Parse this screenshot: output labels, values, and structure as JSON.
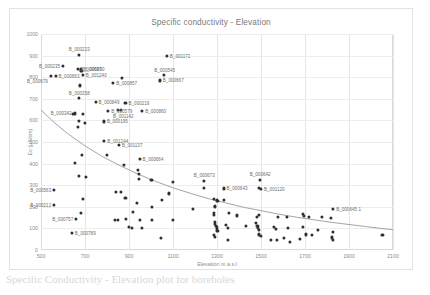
{
  "chart_data": {
    "type": "scatter",
    "title": "Specific conductivity - Elevation",
    "xlabel": "Elevation m a.s.l",
    "ylabel": "Ec (µS/cm)",
    "xlim": [
      500,
      2100
    ],
    "ylim": [
      0,
      1000
    ],
    "xticks": [
      500,
      700,
      900,
      1100,
      1300,
      1500,
      1700,
      1900,
      2100
    ],
    "yticks": [
      0,
      100,
      200,
      300,
      400,
      500,
      600,
      700,
      800,
      900,
      1000
    ],
    "grid": true,
    "legend": "none",
    "marker_color": "#2f2f2f",
    "trendline_color": "#9a9a9a",
    "trendline_type": "power/exponential decay",
    "series": [
      {
        "name": "Boreholes",
        "points": [
          {
            "x": 672,
            "y": 905,
            "label": "B_000223",
            "label_pos": "above"
          },
          {
            "x": 1072,
            "y": 900,
            "label": "B_001172",
            "label_pos": "right"
          },
          {
            "x": 600,
            "y": 852,
            "label": "B_000235",
            "label_pos": "left"
          },
          {
            "x": 667,
            "y": 840,
            "label": "B_000637",
            "label_pos": "right"
          },
          {
            "x": 680,
            "y": 836,
            "label": "B_000890",
            "label_pos": "right"
          },
          {
            "x": 684,
            "y": 828,
            "label": "",
            "label_pos": ""
          },
          {
            "x": 566,
            "y": 806,
            "label": "B_000663",
            "label_pos": "right"
          },
          {
            "x": 690,
            "y": 812,
            "label": "B_001240",
            "label_pos": "right"
          },
          {
            "x": 545,
            "y": 804,
            "label": "B_000679",
            "label_pos": "below-left"
          },
          {
            "x": 1060,
            "y": 810,
            "label": "B_000545",
            "label_pos": "above"
          },
          {
            "x": 1040,
            "y": 785,
            "label": "B_000667",
            "label_pos": "right"
          },
          {
            "x": 870,
            "y": 795,
            "label": "",
            "label_pos": ""
          },
          {
            "x": 828,
            "y": 772,
            "label": "B_000857",
            "label_pos": "right"
          },
          {
            "x": 676,
            "y": 762,
            "label": "",
            "label_pos": ""
          },
          {
            "x": 672,
            "y": 703,
            "label": "B_000358",
            "label_pos": "above"
          },
          {
            "x": 748,
            "y": 684,
            "label": "B_000849",
            "label_pos": "right"
          },
          {
            "x": 884,
            "y": 680,
            "label": "B_000219",
            "label_pos": "right"
          },
          {
            "x": 806,
            "y": 645,
            "label": "B_000579",
            "label_pos": "right"
          },
          {
            "x": 848,
            "y": 650,
            "label": "",
            "label_pos": ""
          },
          {
            "x": 864,
            "y": 648,
            "label": "B_001142",
            "label_pos": "below"
          },
          {
            "x": 960,
            "y": 642,
            "label": "B_000860",
            "label_pos": "right"
          },
          {
            "x": 653,
            "y": 632,
            "label": "B_000342",
            "label_pos": "left"
          },
          {
            "x": 646,
            "y": 628,
            "label": "",
            "label_pos": ""
          },
          {
            "x": 692,
            "y": 630,
            "label": "",
            "label_pos": ""
          },
          {
            "x": 672,
            "y": 597,
            "label": "",
            "label_pos": ""
          },
          {
            "x": 700,
            "y": 588,
            "label": "",
            "label_pos": ""
          },
          {
            "x": 786,
            "y": 595,
            "label": "B_000195",
            "label_pos": "right"
          },
          {
            "x": 666,
            "y": 570,
            "label": "",
            "label_pos": ""
          },
          {
            "x": 788,
            "y": 503,
            "label": "B_001244",
            "label_pos": "right"
          },
          {
            "x": 854,
            "y": 488,
            "label": "B_001137",
            "label_pos": "right"
          },
          {
            "x": 686,
            "y": 438,
            "label": "",
            "label_pos": ""
          },
          {
            "x": 800,
            "y": 440,
            "label": "",
            "label_pos": ""
          },
          {
            "x": 948,
            "y": 422,
            "label": "B_000664",
            "label_pos": "right"
          },
          {
            "x": 654,
            "y": 405,
            "label": "",
            "label_pos": ""
          },
          {
            "x": 878,
            "y": 392,
            "label": "",
            "label_pos": ""
          },
          {
            "x": 940,
            "y": 372,
            "label": "",
            "label_pos": ""
          },
          {
            "x": 944,
            "y": 352,
            "label": "",
            "label_pos": ""
          },
          {
            "x": 674,
            "y": 342,
            "label": "",
            "label_pos": ""
          },
          {
            "x": 706,
            "y": 340,
            "label": "",
            "label_pos": ""
          },
          {
            "x": 946,
            "y": 328,
            "label": "",
            "label_pos": ""
          },
          {
            "x": 1002,
            "y": 325,
            "label": "",
            "label_pos": ""
          },
          {
            "x": 1098,
            "y": 315,
            "label": "",
            "label_pos": ""
          },
          {
            "x": 1240,
            "y": 320,
            "label": "B_000673",
            "label_pos": "above"
          },
          {
            "x": 1494,
            "y": 326,
            "label": "B_000642",
            "label_pos": "above"
          },
          {
            "x": 1240,
            "y": 288,
            "label": "",
            "label_pos": ""
          },
          {
            "x": 1330,
            "y": 285,
            "label": "B_000643",
            "label_pos": "right"
          },
          {
            "x": 1492,
            "y": 288,
            "label": "",
            "label_pos": ""
          },
          {
            "x": 1500,
            "y": 283,
            "label": "B_001120",
            "label_pos": "right"
          },
          {
            "x": 560,
            "y": 278,
            "label": "B_000563",
            "label_pos": "left"
          },
          {
            "x": 840,
            "y": 268,
            "label": "",
            "label_pos": ""
          },
          {
            "x": 862,
            "y": 268,
            "label": "",
            "label_pos": ""
          },
          {
            "x": 1080,
            "y": 262,
            "label": "",
            "label_pos": ""
          },
          {
            "x": 884,
            "y": 242,
            "label": "",
            "label_pos": ""
          },
          {
            "x": 692,
            "y": 238,
            "label": "",
            "label_pos": ""
          },
          {
            "x": 1050,
            "y": 232,
            "label": "",
            "label_pos": ""
          },
          {
            "x": 1286,
            "y": 236,
            "label": "",
            "label_pos": ""
          },
          {
            "x": 1300,
            "y": 233,
            "label": "",
            "label_pos": ""
          },
          {
            "x": 1302,
            "y": 228,
            "label": "",
            "label_pos": ""
          },
          {
            "x": 1330,
            "y": 233,
            "label": "",
            "label_pos": ""
          },
          {
            "x": 936,
            "y": 218,
            "label": "",
            "label_pos": ""
          },
          {
            "x": 1004,
            "y": 200,
            "label": "",
            "label_pos": ""
          },
          {
            "x": 560,
            "y": 208,
            "label": "B_000212",
            "label_pos": "left"
          },
          {
            "x": 1290,
            "y": 205,
            "label": "",
            "label_pos": ""
          },
          {
            "x": 1292,
            "y": 198,
            "label": "",
            "label_pos": ""
          },
          {
            "x": 1190,
            "y": 188,
            "label": "",
            "label_pos": ""
          },
          {
            "x": 1828,
            "y": 192,
            "label": "B_000645 1",
            "label_pos": "right"
          },
          {
            "x": 682,
            "y": 172,
            "label": "",
            "label_pos": ""
          },
          {
            "x": 918,
            "y": 177,
            "label": "",
            "label_pos": ""
          },
          {
            "x": 1286,
            "y": 170,
            "label": "",
            "label_pos": ""
          },
          {
            "x": 1288,
            "y": 162,
            "label": "",
            "label_pos": ""
          },
          {
            "x": 1356,
            "y": 170,
            "label": "",
            "label_pos": ""
          },
          {
            "x": 1390,
            "y": 160,
            "label": "",
            "label_pos": ""
          },
          {
            "x": 1482,
            "y": 155,
            "label": "",
            "label_pos": ""
          },
          {
            "x": 1492,
            "y": 162,
            "label": "",
            "label_pos": ""
          },
          {
            "x": 1578,
            "y": 155,
            "label": "",
            "label_pos": ""
          },
          {
            "x": 1618,
            "y": 152,
            "label": "",
            "label_pos": ""
          },
          {
            "x": 1690,
            "y": 168,
            "label": "",
            "label_pos": ""
          },
          {
            "x": 1696,
            "y": 156,
            "label": "",
            "label_pos": ""
          },
          {
            "x": 1718,
            "y": 152,
            "label": "",
            "label_pos": ""
          },
          {
            "x": 1776,
            "y": 155,
            "label": "",
            "label_pos": ""
          },
          {
            "x": 1818,
            "y": 148,
            "label": "",
            "label_pos": ""
          },
          {
            "x": 660,
            "y": 142,
            "label": "B_000757",
            "label_pos": "left"
          },
          {
            "x": 838,
            "y": 140,
            "label": "",
            "label_pos": ""
          },
          {
            "x": 848,
            "y": 140,
            "label": "",
            "label_pos": ""
          },
          {
            "x": 886,
            "y": 142,
            "label": "",
            "label_pos": ""
          },
          {
            "x": 950,
            "y": 138,
            "label": "",
            "label_pos": ""
          },
          {
            "x": 1004,
            "y": 140,
            "label": "",
            "label_pos": ""
          },
          {
            "x": 1098,
            "y": 140,
            "label": "",
            "label_pos": ""
          },
          {
            "x": 1290,
            "y": 128,
            "label": "",
            "label_pos": ""
          },
          {
            "x": 1292,
            "y": 120,
            "label": "",
            "label_pos": ""
          },
          {
            "x": 1296,
            "y": 112,
            "label": "",
            "label_pos": ""
          },
          {
            "x": 1298,
            "y": 105,
            "label": "",
            "label_pos": ""
          },
          {
            "x": 1300,
            "y": 98,
            "label": "",
            "label_pos": ""
          },
          {
            "x": 1302,
            "y": 90,
            "label": "",
            "label_pos": ""
          },
          {
            "x": 1340,
            "y": 118,
            "label": "",
            "label_pos": ""
          },
          {
            "x": 1348,
            "y": 104,
            "label": "",
            "label_pos": ""
          },
          {
            "x": 1432,
            "y": 110,
            "label": "",
            "label_pos": ""
          },
          {
            "x": 1478,
            "y": 126,
            "label": "",
            "label_pos": ""
          },
          {
            "x": 1484,
            "y": 112,
            "label": "",
            "label_pos": ""
          },
          {
            "x": 1488,
            "y": 102,
            "label": "",
            "label_pos": ""
          },
          {
            "x": 1490,
            "y": 92,
            "label": "",
            "label_pos": ""
          },
          {
            "x": 1560,
            "y": 108,
            "label": "",
            "label_pos": ""
          },
          {
            "x": 1566,
            "y": 96,
            "label": "",
            "label_pos": ""
          },
          {
            "x": 1624,
            "y": 100,
            "label": "",
            "label_pos": ""
          },
          {
            "x": 1690,
            "y": 106,
            "label": "",
            "label_pos": ""
          },
          {
            "x": 1760,
            "y": 92,
            "label": "",
            "label_pos": ""
          },
          {
            "x": 1826,
            "y": 84,
            "label": "",
            "label_pos": ""
          },
          {
            "x": 900,
            "y": 108,
            "label": "",
            "label_pos": ""
          },
          {
            "x": 912,
            "y": 104,
            "label": "",
            "label_pos": ""
          },
          {
            "x": 958,
            "y": 104,
            "label": "",
            "label_pos": ""
          },
          {
            "x": 1046,
            "y": 57,
            "label": "",
            "label_pos": ""
          },
          {
            "x": 1286,
            "y": 70,
            "label": "",
            "label_pos": ""
          },
          {
            "x": 1290,
            "y": 62,
            "label": "",
            "label_pos": ""
          },
          {
            "x": 1350,
            "y": 45,
            "label": "",
            "label_pos": ""
          },
          {
            "x": 1492,
            "y": 72,
            "label": "",
            "label_pos": ""
          },
          {
            "x": 1498,
            "y": 64,
            "label": "",
            "label_pos": ""
          },
          {
            "x": 1546,
            "y": 48,
            "label": "",
            "label_pos": ""
          },
          {
            "x": 1572,
            "y": 46,
            "label": "",
            "label_pos": ""
          },
          {
            "x": 1606,
            "y": 56,
            "label": "",
            "label_pos": ""
          },
          {
            "x": 1630,
            "y": 38,
            "label": "",
            "label_pos": ""
          },
          {
            "x": 1678,
            "y": 52,
            "label": "",
            "label_pos": ""
          },
          {
            "x": 1704,
            "y": 72,
            "label": "",
            "label_pos": ""
          },
          {
            "x": 1732,
            "y": 68,
            "label": "",
            "label_pos": ""
          },
          {
            "x": 1822,
            "y": 58,
            "label": "",
            "label_pos": ""
          },
          {
            "x": 1828,
            "y": 48,
            "label": "",
            "label_pos": ""
          },
          {
            "x": 2052,
            "y": 68,
            "label": "",
            "label_pos": ""
          },
          {
            "x": 640,
            "y": 78,
            "label": "B_000789",
            "label_pos": "right"
          }
        ]
      }
    ],
    "trendline_points": [
      {
        "x": 500,
        "y": 648
      },
      {
        "x": 560,
        "y": 590
      },
      {
        "x": 620,
        "y": 540
      },
      {
        "x": 700,
        "y": 482
      },
      {
        "x": 780,
        "y": 432
      },
      {
        "x": 860,
        "y": 390
      },
      {
        "x": 940,
        "y": 352
      },
      {
        "x": 1020,
        "y": 318
      },
      {
        "x": 1100,
        "y": 288
      },
      {
        "x": 1180,
        "y": 262
      },
      {
        "x": 1260,
        "y": 238
      },
      {
        "x": 1340,
        "y": 218
      },
      {
        "x": 1420,
        "y": 198
      },
      {
        "x": 1500,
        "y": 182
      },
      {
        "x": 1580,
        "y": 166
      },
      {
        "x": 1660,
        "y": 152
      },
      {
        "x": 1740,
        "y": 140
      },
      {
        "x": 1820,
        "y": 128
      },
      {
        "x": 1900,
        "y": 118
      },
      {
        "x": 1980,
        "y": 108
      },
      {
        "x": 2060,
        "y": 98
      },
      {
        "x": 2100,
        "y": 94
      }
    ]
  },
  "caption": {
    "text": "Specific Conductivity - Elevation plot for boreholes"
  }
}
